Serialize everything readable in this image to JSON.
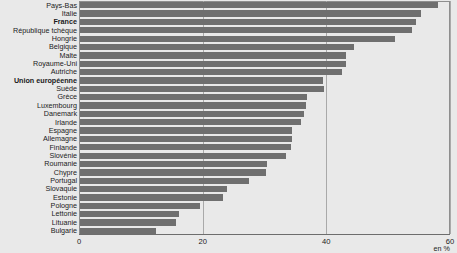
{
  "chart_data": {
    "type": "bar",
    "orientation": "horizontal",
    "title": "",
    "subtitle": "",
    "xlabel": "en %",
    "ylabel": "",
    "xlim": [
      0,
      60
    ],
    "xticks": [
      0,
      20,
      40,
      60
    ],
    "xtick_labels": [
      "0",
      "20",
      "40",
      "60"
    ],
    "grid": true,
    "grid_axis": "x",
    "legend": null,
    "bar_color": "#6f6f6f",
    "background_color": "#e9e9e9",
    "highlight_labels": [
      "France",
      "Union européenne"
    ],
    "categories": [
      "Pays-Bas",
      "Italie",
      "France",
      "République tchèque",
      "Hongrie",
      "Belgique",
      "Malte",
      "Royaume-Uni",
      "Autriche",
      "Union européenne",
      "Suède",
      "Grèce",
      "Luxembourg",
      "Danemark",
      "Irlande",
      "Espagne",
      "Allemagne",
      "Finlande",
      "Slovénie",
      "Roumanie",
      "Chypre",
      "Portugal",
      "Slovaquie",
      "Estonie",
      "Pologne",
      "Lettonie",
      "Lituanie",
      "Bulgarie"
    ],
    "values": [
      57.9,
      55.2,
      54.4,
      53.7,
      51.0,
      44.3,
      43.0,
      43.0,
      42.4,
      39.3,
      39.5,
      36.7,
      36.6,
      36.2,
      35.8,
      34.3,
      34.3,
      34.1,
      33.3,
      30.3,
      30.1,
      27.3,
      23.8,
      23.1,
      19.4,
      16.0,
      15.5,
      12.3
    ]
  },
  "axis": {
    "unit_label": "en %"
  }
}
